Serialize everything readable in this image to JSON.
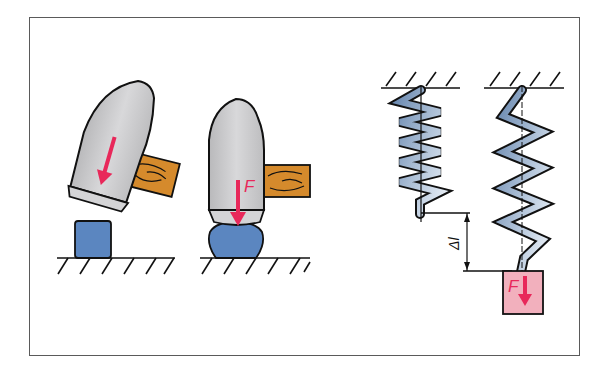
{
  "figure": {
    "colors": {
      "frame": "#5a5a5a",
      "hammer_head": "#c9c9cb",
      "handle_wood": "#d58a2c",
      "block": "#5b86c0",
      "spring": "#8fa9c8",
      "weight": "#f2b0bd",
      "force_arrow": "#e8285a",
      "ground": "#111111"
    },
    "panels": [
      {
        "id": "hammer-before-impact",
        "label": ""
      },
      {
        "id": "hammer-after-impact",
        "label": "F"
      },
      {
        "id": "spring-unloaded",
        "label": ""
      },
      {
        "id": "spring-loaded",
        "label": "F",
        "extension_label": "Δl"
      }
    ]
  }
}
